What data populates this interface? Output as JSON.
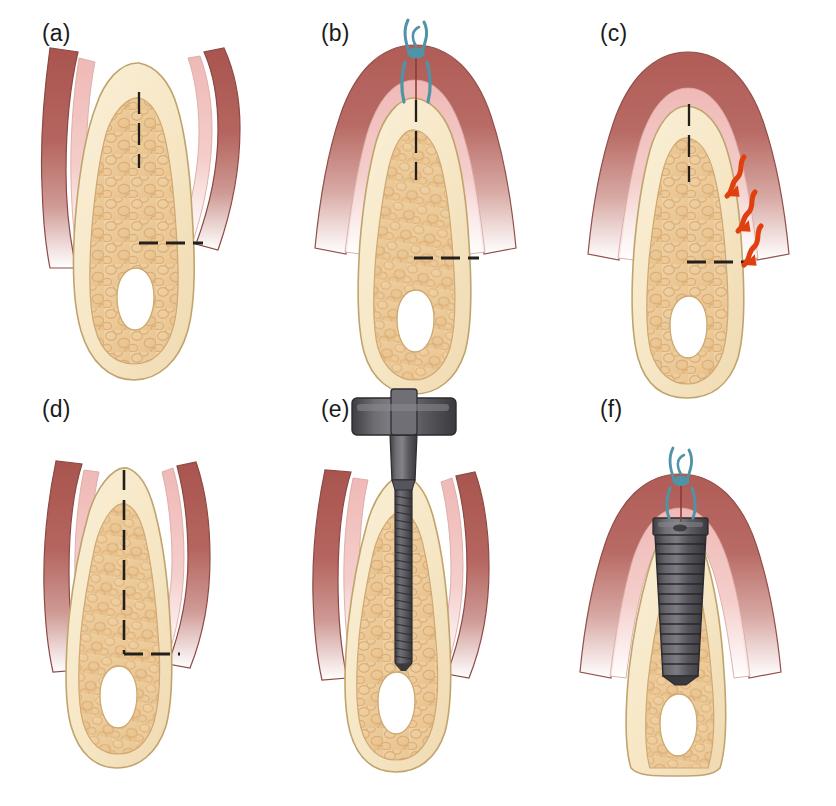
{
  "figure": {
    "width": 836,
    "height": 806,
    "background": "#ffffff"
  },
  "palette": {
    "gingiva_outer": "#b5655f",
    "gingiva_outer_dark": "#a9544f",
    "gingiva_inner": "#e8a9a6",
    "gingiva_inner_light": "#f2c9c6",
    "cortical_bone": "#f6e8c8",
    "cortical_bone_edge": "#c9b07a",
    "trabecular_bone": "#eecfa0",
    "trabecular_cell": "#e2b87e",
    "canal_void": "#ffffff",
    "dashed_line": "#231f1c",
    "suture_blue": "#4f93a6",
    "arrow_red": "#e0400f",
    "implant_dark": "#46464a",
    "implant_mid": "#5c5c60",
    "implant_light": "#76767a",
    "label_text": "#1a1a1a"
  },
  "panels": [
    {
      "id": "a",
      "label": "(a)",
      "caption": "Narrow edentulous ridge with reflected full-thickness mucoperiosteal flaps; dashed lines mark the planned crestal osteotomy depth and the ridge width reference level",
      "row": 0,
      "col": 0,
      "elements": [
        "gingival-flap-left",
        "gingival-flap-right",
        "cortical-bone-ridge",
        "trabecular-bone",
        "inferior-alveolar-canal",
        "dashed-vertical-line",
        "dashed-horizontal-line"
      ],
      "annotations": {
        "vertical_dashes": 3,
        "horizontal_dashes": 3,
        "suture": false,
        "arrows": 0,
        "instrument": "none"
      }
    },
    {
      "id": "b",
      "label": "(b)",
      "caption": "Flaps repositioned and closed over the ridge with an interrupted suture at the crest",
      "row": 0,
      "col": 1,
      "elements": [
        "gingival-dome-closed",
        "suture-knot",
        "suture-stitch-left",
        "suture-stitch-right",
        "cortical-bone-ridge",
        "trabecular-bone",
        "inferior-alveolar-canal",
        "dashed-vertical-line",
        "dashed-horizontal-line"
      ],
      "annotations": {
        "vertical_dashes": 3,
        "horizontal_dashes": 3,
        "suture": true,
        "arrows": 0,
        "instrument": "none"
      }
    },
    {
      "id": "c",
      "label": "(c)",
      "caption": "Healing phase; wavy arrows indicate progressive buccal bone resorption along the ridge",
      "row": 0,
      "col": 2,
      "elements": [
        "gingival-dome-closed",
        "cortical-bone-ridge",
        "trabecular-bone",
        "inferior-alveolar-canal",
        "dashed-vertical-line",
        "dashed-horizontal-line",
        "resorption-arrow-1",
        "resorption-arrow-2",
        "resorption-arrow-3"
      ],
      "annotations": {
        "vertical_dashes": 3,
        "horizontal_dashes": 3,
        "suture": false,
        "arrows": 3,
        "arrow_direction": "down-left",
        "instrument": "none"
      }
    },
    {
      "id": "d",
      "label": "(d)",
      "caption": "Healed, remodelled narrow ridge re-exposed with reflected flaps; dashed lines show the available bone height and width",
      "row": 1,
      "col": 0,
      "elements": [
        "gingival-flap-left",
        "gingival-flap-right",
        "cortical-bone-ridge-narrow",
        "trabecular-bone",
        "inferior-alveolar-canal",
        "dashed-vertical-line-long",
        "dashed-horizontal-line"
      ],
      "annotations": {
        "vertical_dashes": 7,
        "horizontal_dashes": 3,
        "suture": false,
        "arrows": 0,
        "instrument": "none"
      }
    },
    {
      "id": "e",
      "label": "(e)",
      "caption": "Osteotomy preparation: threaded bone expander / drill with T-handle advanced into the crest",
      "row": 1,
      "col": 1,
      "elements": [
        "gingival-flap-left",
        "gingival-flap-right",
        "cortical-bone-ridge-narrow",
        "trabecular-bone",
        "inferior-alveolar-canal",
        "instrument-t-handle",
        "instrument-collar",
        "instrument-threaded-shaft"
      ],
      "annotations": {
        "vertical_dashes": 0,
        "horizontal_dashes": 0,
        "suture": false,
        "arrows": 0,
        "instrument": "threaded-expander-with-t-handle"
      }
    },
    {
      "id": "f",
      "label": "(f)",
      "caption": "Endosseous threaded implant seated to crestal level with the flap sutured closed over it",
      "row": 1,
      "col": 2,
      "elements": [
        "gingival-dome-closed",
        "suture-knot",
        "suture-stitch-left",
        "suture-stitch-right",
        "cortical-bone-ridge-narrow",
        "trabecular-bone",
        "inferior-alveolar-canal",
        "dental-implant-body",
        "dental-implant-collar"
      ],
      "annotations": {
        "vertical_dashes": 0,
        "horizontal_dashes": 0,
        "suture": true,
        "arrows": 0,
        "instrument": "endosseous-implant"
      }
    }
  ]
}
